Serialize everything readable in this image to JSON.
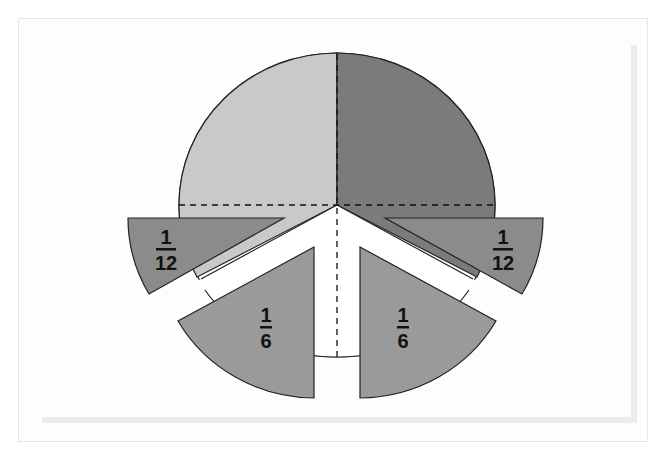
{
  "diagram": {
    "colors": {
      "light_quarter": "#c9c9c9",
      "dark_quarter": "#7b7b7b",
      "twelfth_piece": "#8b8b8b",
      "sixth_piece": "#9a9a9a",
      "outline": "#222222",
      "background": "#ffffff"
    },
    "labels": {
      "left_twelfth": {
        "numerator": "1",
        "denominator": "12"
      },
      "right_twelfth": {
        "numerator": "1",
        "denominator": "12"
      },
      "left_sixth": {
        "numerator": "1",
        "denominator": "6"
      },
      "right_sixth": {
        "numerator": "1",
        "denominator": "6"
      }
    }
  }
}
